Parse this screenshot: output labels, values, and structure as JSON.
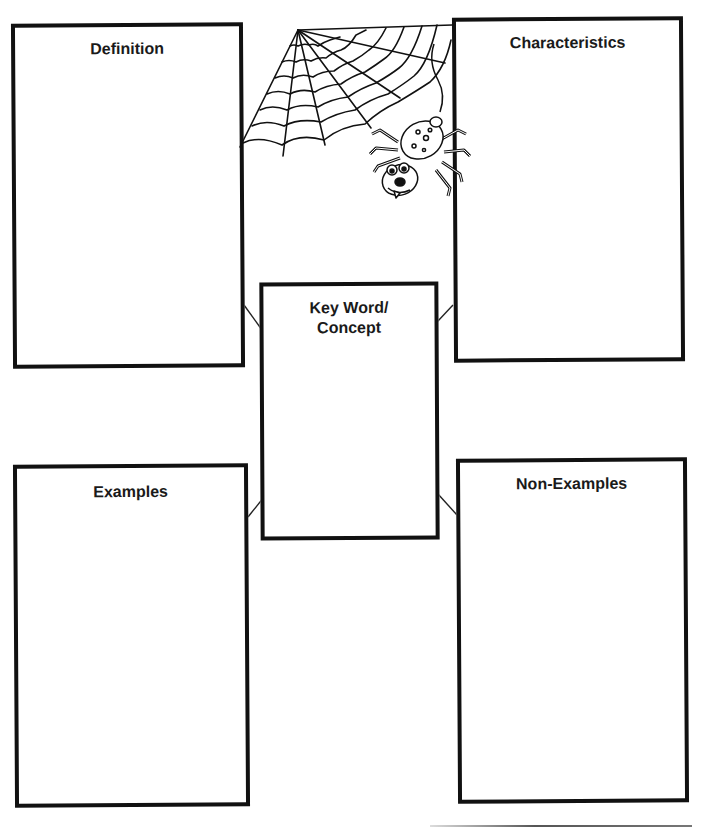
{
  "page": {
    "type": "graphic-organizer",
    "theme": "spider-web"
  },
  "header": {
    "cut_off_text": "— — — —"
  },
  "boxes": {
    "definition": {
      "label": "Definition"
    },
    "characteristics": {
      "label": "Characteristics"
    },
    "keyword": {
      "label_line1": "Key Word/",
      "label_line2": "Concept"
    },
    "examples": {
      "label": "Examples"
    },
    "non_examples": {
      "label": "Non-Examples"
    }
  },
  "illustrations": {
    "web": "spider-web-icon",
    "spider": "cartoon-spider-icon"
  },
  "colors": {
    "border": "#111111",
    "background": "#ffffff",
    "text": "#1a1a1a"
  }
}
